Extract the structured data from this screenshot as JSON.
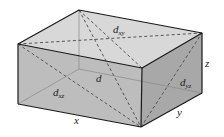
{
  "diagram": {
    "colors": {
      "top_face": "#d6d6d6",
      "front_face": "#bcbcbc",
      "right_face": "#a9a9a9",
      "edge": "#1a1a1a",
      "hidden_edge": "#8a8a8a",
      "diagonal": "#555555"
    },
    "labels": {
      "dxy": {
        "main": "d",
        "sub": "xy"
      },
      "d": {
        "main": "d"
      },
      "dxz": {
        "main": "d",
        "sub": "xz"
      },
      "dyz": {
        "main": "d",
        "sub": "yz"
      },
      "x": "x",
      "y": "y",
      "z": "z"
    }
  }
}
